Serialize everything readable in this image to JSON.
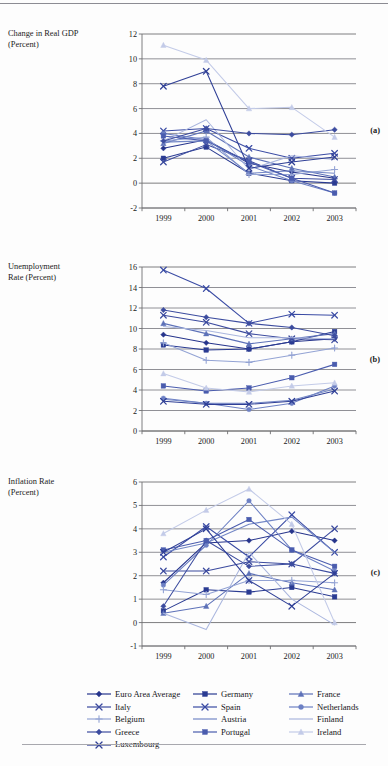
{
  "figure": {
    "panels": [
      {
        "id": "a",
        "label": "(a)",
        "axis_title_line1": "Change in Real GDP",
        "axis_title_line2": "(Percent)"
      },
      {
        "id": "b",
        "label": "(b)",
        "axis_title_line1": "Unemployment",
        "axis_title_line2": "Rate (Percent)"
      },
      {
        "id": "c",
        "label": "(c)",
        "axis_title_line1": "Inflation Rate",
        "axis_title_line2": "(Percent)"
      }
    ]
  },
  "legend": {
    "position": "bottom",
    "entries": [
      {
        "name": "Euro Area Average",
        "color": "#26348c",
        "marker": "diamond"
      },
      {
        "name": "Germany",
        "color": "#2a3b92",
        "marker": "square"
      },
      {
        "name": "France",
        "color": "#5d71b8",
        "marker": "triangle"
      },
      {
        "name": "Italy",
        "color": "#3b4a9e",
        "marker": "x"
      },
      {
        "name": "Spain",
        "color": "#3a4ba4",
        "marker": "x"
      },
      {
        "name": "Netherlands",
        "color": "#6d80c4",
        "marker": "circle"
      },
      {
        "name": "Belgium",
        "color": "#93a3d4",
        "marker": "plus"
      },
      {
        "name": "Austria",
        "color": "#7387c6",
        "marker": "line"
      },
      {
        "name": "Finland",
        "color": "#aab6de",
        "marker": "line"
      },
      {
        "name": "Greece",
        "color": "#3c4c9f",
        "marker": "diamond"
      },
      {
        "name": "Portugal",
        "color": "#4a5cae",
        "marker": "square"
      },
      {
        "name": "Ireland",
        "color": "#c3cbe8",
        "marker": "triangle"
      },
      {
        "name": "Luxembourg",
        "color": "#2f3f96",
        "marker": "x"
      }
    ]
  },
  "chart_data": [
    {
      "type": "line",
      "id": "a",
      "title": "Change in Real GDP (Percent)",
      "ylabel": "Change in Real GDP (Percent)",
      "xlabel": "",
      "categories": [
        "1999",
        "2000",
        "2001",
        "2002",
        "2003"
      ],
      "ylim": [
        -2,
        12
      ],
      "yticks": [
        -2,
        0,
        2,
        4,
        6,
        8,
        10,
        12
      ],
      "grid": true,
      "series": [
        {
          "name": "Euro Area Average",
          "values": [
            2.8,
            3.5,
            1.6,
            0.9,
            0.4
          ]
        },
        {
          "name": "Germany",
          "values": [
            2.0,
            2.9,
            0.8,
            0.2,
            0.0
          ]
        },
        {
          "name": "France",
          "values": [
            3.2,
            4.2,
            2.1,
            1.2,
            0.5
          ]
        },
        {
          "name": "Italy",
          "values": [
            1.7,
            3.1,
            1.8,
            0.4,
            0.3
          ]
        },
        {
          "name": "Spain",
          "values": [
            4.2,
            4.4,
            2.8,
            2.0,
            2.4
          ]
        },
        {
          "name": "Netherlands",
          "values": [
            4.0,
            3.5,
            1.4,
            0.2,
            -0.8
          ]
        },
        {
          "name": "Belgium",
          "values": [
            3.4,
            3.7,
            0.7,
            0.7,
            1.1
          ]
        },
        {
          "name": "Austria",
          "values": [
            3.3,
            3.4,
            0.8,
            1.0,
            0.8
          ]
        },
        {
          "name": "Finland",
          "values": [
            3.4,
            5.1,
            1.1,
            2.2,
            1.9
          ]
        },
        {
          "name": "Greece",
          "values": [
            3.4,
            4.4,
            4.0,
            3.9,
            4.3
          ]
        },
        {
          "name": "Portugal",
          "values": [
            3.8,
            3.4,
            1.7,
            0.4,
            -0.8
          ]
        },
        {
          "name": "Ireland",
          "values": [
            11.1,
            9.9,
            6.0,
            6.1,
            3.7
          ]
        },
        {
          "name": "Luxembourg",
          "values": [
            7.8,
            9.0,
            1.2,
            1.7,
            2.1
          ]
        }
      ]
    },
    {
      "type": "line",
      "id": "b",
      "title": "Unemployment Rate (Percent)",
      "ylabel": "Unemployment Rate (Percent)",
      "xlabel": "",
      "categories": [
        "1999",
        "2000",
        "2001",
        "2002",
        "2003"
      ],
      "ylim": [
        0,
        16
      ],
      "yticks": [
        0,
        2,
        4,
        6,
        8,
        10,
        12,
        14,
        16
      ],
      "grid": true,
      "series": [
        {
          "name": "Euro Area Average",
          "values": [
            9.4,
            8.6,
            8.0,
            8.7,
            9.0
          ]
        },
        {
          "name": "Germany",
          "values": [
            8.4,
            7.9,
            8.0,
            8.7,
            9.7
          ]
        },
        {
          "name": "France",
          "values": [
            10.5,
            9.5,
            8.5,
            9.0,
            9.5
          ]
        },
        {
          "name": "Italy",
          "values": [
            11.3,
            10.6,
            9.5,
            9.0,
            8.9
          ]
        },
        {
          "name": "Spain",
          "values": [
            15.7,
            13.9,
            10.5,
            11.4,
            11.3
          ]
        },
        {
          "name": "Netherlands",
          "values": [
            3.2,
            2.7,
            2.1,
            2.7,
            4.4
          ]
        },
        {
          "name": "Belgium",
          "values": [
            8.6,
            6.9,
            6.7,
            7.4,
            8.1
          ]
        },
        {
          "name": "Austria",
          "values": [
            3.1,
            2.7,
            2.7,
            3.0,
            4.1
          ]
        },
        {
          "name": "Finland",
          "values": [
            10.2,
            9.8,
            9.1,
            9.1,
            9.0
          ]
        },
        {
          "name": "Greece",
          "values": [
            11.8,
            11.1,
            10.5,
            10.1,
            9.3
          ]
        },
        {
          "name": "Portugal",
          "values": [
            4.4,
            3.9,
            4.2,
            5.2,
            6.5
          ]
        },
        {
          "name": "Ireland",
          "values": [
            5.6,
            4.2,
            3.8,
            4.4,
            4.7
          ]
        },
        {
          "name": "Luxembourg",
          "values": [
            2.9,
            2.6,
            2.6,
            2.9,
            3.9
          ]
        }
      ]
    },
    {
      "type": "line",
      "id": "c",
      "title": "Inflation Rate (Percent)",
      "ylabel": "Inflation Rate (Percent)",
      "xlabel": "",
      "categories": [
        "1999",
        "2000",
        "2001",
        "2002",
        "2003"
      ],
      "ylim": [
        -1,
        6
      ],
      "yticks": [
        -1,
        0,
        1,
        2,
        3,
        4,
        5,
        6
      ],
      "grid": true,
      "series": [
        {
          "name": "Euro Area Average",
          "values": [
            1.7,
            3.4,
            3.5,
            3.9,
            3.5
          ]
        },
        {
          "name": "Germany",
          "values": [
            0.5,
            1.4,
            1.3,
            1.5,
            1.1
          ]
        },
        {
          "name": "France",
          "values": [
            0.4,
            0.7,
            2.1,
            1.7,
            1.4
          ]
        },
        {
          "name": "Italy",
          "values": [
            2.2,
            2.2,
            2.6,
            2.5,
            4.0
          ]
        },
        {
          "name": "Spain",
          "values": [
            2.8,
            4.1,
            2.8,
            4.6,
            3.0
          ]
        },
        {
          "name": "Netherlands",
          "values": [
            1.6,
            3.3,
            5.2,
            3.1,
            2.2
          ]
        },
        {
          "name": "Belgium",
          "values": [
            1.4,
            1.2,
            1.8,
            1.8,
            1.7
          ]
        },
        {
          "name": "Austria",
          "values": [
            3.0,
            3.4,
            4.2,
            4.5,
            3.0
          ]
        },
        {
          "name": "Finland",
          "values": [
            0.4,
            -0.3,
            3.0,
            1.0,
            -0.1
          ]
        },
        {
          "name": "Greece",
          "values": [
            0.7,
            3.5,
            2.4,
            2.5,
            2.1
          ]
        },
        {
          "name": "Portugal",
          "values": [
            3.1,
            3.5,
            4.4,
            3.1,
            2.4
          ]
        },
        {
          "name": "Ireland",
          "values": [
            3.8,
            4.8,
            5.7,
            4.2,
            0.0
          ]
        },
        {
          "name": "Luxembourg",
          "values": [
            3.0,
            4.0,
            1.8,
            0.7,
            2.1
          ]
        }
      ]
    }
  ]
}
